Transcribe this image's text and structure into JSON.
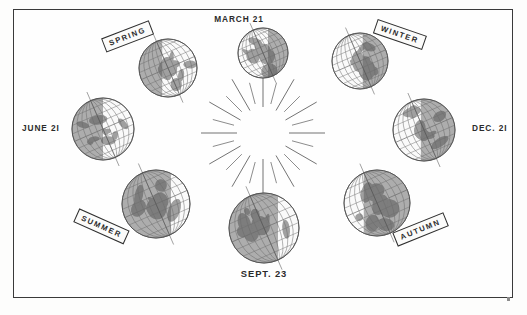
{
  "figure": {
    "caption": "Diagram of the Earth at four positions in its orbit around the Sun, showing the solstices and equinoxes and the corresponding seasons."
  },
  "frame": {
    "border_color": "#3a3a3a",
    "background_color": "#fefefe"
  },
  "sun": {
    "name": "sun-rays",
    "ray_count": 24,
    "center_x": 263,
    "center_y": 133,
    "inner_radius": 26,
    "outer_radius_long": 62,
    "outer_radius_short": 52,
    "stroke_color": "#5a5a5a"
  },
  "date_labels": [
    {
      "id": "march",
      "text": "MARCH  21",
      "position": "top"
    },
    {
      "id": "june",
      "text": "JUNE  2I",
      "position": "left"
    },
    {
      "id": "dec",
      "text": "DEC. 2I",
      "position": "right"
    },
    {
      "id": "sept",
      "text": "SEPT. 23",
      "position": "bottom"
    }
  ],
  "season_banners": [
    {
      "id": "spring",
      "text": "SPRING",
      "position": "top-left",
      "rotation": -21
    },
    {
      "id": "winter",
      "text": "WINTER",
      "position": "top-right",
      "rotation": 19
    },
    {
      "id": "summer",
      "text": "SUMMER",
      "position": "bottom-left",
      "rotation": 24
    },
    {
      "id": "autumn",
      "text": "AUTUMN",
      "position": "bottom-right",
      "rotation": -22
    }
  ],
  "globes": [
    {
      "id": "globe-march",
      "label": "MARCH  21",
      "cx": 263,
      "cy": 53,
      "r": 25,
      "shadow_side": "right",
      "shadow_fraction": 0.4,
      "tilt": -23.5
    },
    {
      "id": "globe-spring",
      "label": "SPRING",
      "cx": 168,
      "cy": 68,
      "r": 29,
      "shadow_side": "left",
      "shadow_fraction": 0.4,
      "tilt": -23.5
    },
    {
      "id": "globe-june",
      "label": "JUNE  2I",
      "cx": 103,
      "cy": 129,
      "r": 31,
      "shadow_side": "left",
      "shadow_fraction": 0.5,
      "tilt": -23.5
    },
    {
      "id": "globe-summer",
      "label": "SUMMER",
      "cx": 156,
      "cy": 204,
      "r": 34,
      "shadow_side": "left",
      "shadow_fraction": 0.72,
      "tilt": -23.5
    },
    {
      "id": "globe-sept",
      "label": "SEPT. 23",
      "cx": 264,
      "cy": 228,
      "r": 35,
      "shadow_side": "left",
      "shadow_fraction": 0.7,
      "tilt": -23.5
    },
    {
      "id": "globe-autumn",
      "label": "AUTUMN",
      "cx": 377,
      "cy": 203,
      "r": 33,
      "shadow_side": "right",
      "shadow_fraction": 0.7,
      "tilt": -23.5
    },
    {
      "id": "globe-dec",
      "label": "DEC. 2I",
      "cx": 424,
      "cy": 130,
      "r": 31,
      "shadow_side": "right",
      "shadow_fraction": 0.55,
      "tilt": -23.5
    },
    {
      "id": "globe-winter",
      "label": "WINTER",
      "cx": 360,
      "cy": 61,
      "r": 28,
      "shadow_side": "right",
      "shadow_fraction": 0.45,
      "tilt": -23.5
    }
  ],
  "colors": {
    "ink": "#2b2b2b",
    "ray": "#5a5a5a",
    "globe_grid": "#6c6c6c",
    "globe_light": "#fafafa",
    "globe_shadow": "#8f8f8f",
    "land": "#565656",
    "page": "#fdfdfc"
  }
}
